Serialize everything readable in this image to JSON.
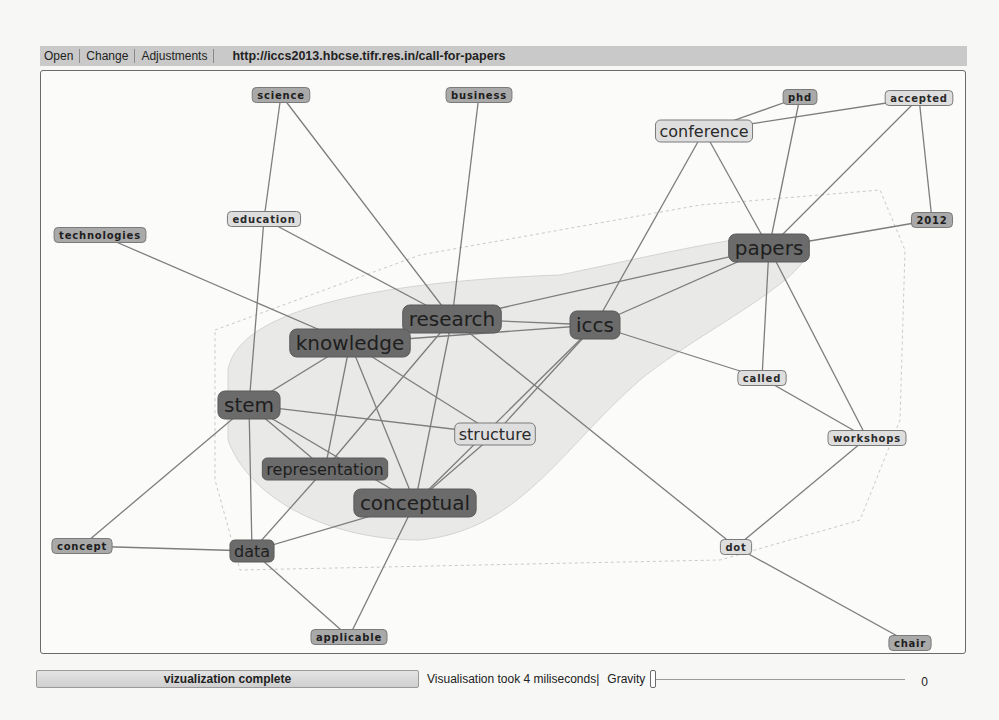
{
  "menubar": {
    "items": [
      "Open",
      "Change",
      "Adjustments"
    ],
    "url": "http://iccs2013.hbcse.tifr.res.in/call-for-papers"
  },
  "status": {
    "progress_label": "vizualization complete",
    "timing_text": "Visualisation took 4 miliseconds|",
    "gravity_label": "Gravity",
    "gravity_value": "0"
  },
  "colors": {
    "node_dark": "#6b6b6b",
    "node_medium": "#a9a9a9",
    "node_light": "#dedede",
    "node_border": "#7a7a7a",
    "edge": "#7d7d7d",
    "cluster_fill": "#e6e6e4"
  },
  "graph": {
    "nodes": [
      {
        "id": "science",
        "label": "science",
        "x": 281,
        "y": 95,
        "size": "small",
        "shade": "medium"
      },
      {
        "id": "business",
        "label": "business",
        "x": 479,
        "y": 95,
        "size": "small",
        "shade": "medium"
      },
      {
        "id": "phd",
        "label": "phd",
        "x": 800,
        "y": 97,
        "size": "small",
        "shade": "medium"
      },
      {
        "id": "accepted",
        "label": "accepted",
        "x": 919,
        "y": 98,
        "size": "small",
        "shade": "light"
      },
      {
        "id": "conference",
        "label": "conference",
        "x": 704,
        "y": 131,
        "size": "medium",
        "shade": "light"
      },
      {
        "id": "education",
        "label": "education",
        "x": 264,
        "y": 219,
        "size": "small",
        "shade": "light"
      },
      {
        "id": "technologies",
        "label": "technologies",
        "x": 100,
        "y": 235,
        "size": "small",
        "shade": "medium"
      },
      {
        "id": "2012",
        "label": "2012",
        "x": 932,
        "y": 220,
        "size": "small",
        "shade": "medium"
      },
      {
        "id": "papers",
        "label": "papers",
        "x": 769,
        "y": 248,
        "size": "large",
        "shade": "dark"
      },
      {
        "id": "research",
        "label": "research",
        "x": 452,
        "y": 319,
        "size": "large",
        "shade": "dark"
      },
      {
        "id": "iccs",
        "label": "iccs",
        "x": 595,
        "y": 325,
        "size": "large",
        "shade": "dark"
      },
      {
        "id": "knowledge",
        "label": "knowledge",
        "x": 350,
        "y": 343,
        "size": "large",
        "shade": "dark"
      },
      {
        "id": "called",
        "label": "called",
        "x": 762,
        "y": 378,
        "size": "small",
        "shade": "light"
      },
      {
        "id": "stem",
        "label": "stem",
        "x": 249,
        "y": 405,
        "size": "large",
        "shade": "dark"
      },
      {
        "id": "structure",
        "label": "structure",
        "x": 495,
        "y": 434,
        "size": "medium",
        "shade": "light"
      },
      {
        "id": "workshops",
        "label": "workshops",
        "x": 867,
        "y": 438,
        "size": "small",
        "shade": "light"
      },
      {
        "id": "representation",
        "label": "representation",
        "x": 325,
        "y": 469,
        "size": "medium",
        "shade": "dark"
      },
      {
        "id": "conceptual",
        "label": "conceptual",
        "x": 415,
        "y": 503,
        "size": "large",
        "shade": "dark"
      },
      {
        "id": "concept",
        "label": "concept",
        "x": 82,
        "y": 546,
        "size": "small",
        "shade": "medium"
      },
      {
        "id": "data",
        "label": "data",
        "x": 252,
        "y": 551,
        "size": "medium",
        "shade": "dark"
      },
      {
        "id": "dot",
        "label": "dot",
        "x": 736,
        "y": 547,
        "size": "small",
        "shade": "light"
      },
      {
        "id": "applicable",
        "label": "applicable",
        "x": 349,
        "y": 637,
        "size": "small",
        "shade": "medium"
      },
      {
        "id": "chair",
        "label": "chair",
        "x": 910,
        "y": 643,
        "size": "small",
        "shade": "medium"
      }
    ],
    "edges": [
      [
        "science",
        "education"
      ],
      [
        "science",
        "research"
      ],
      [
        "business",
        "research"
      ],
      [
        "technologies",
        "knowledge"
      ],
      [
        "education",
        "stem"
      ],
      [
        "education",
        "research"
      ],
      [
        "phd",
        "conference"
      ],
      [
        "phd",
        "papers"
      ],
      [
        "accepted",
        "conference"
      ],
      [
        "accepted",
        "papers"
      ],
      [
        "accepted",
        "2012"
      ],
      [
        "conference",
        "iccs"
      ],
      [
        "conference",
        "papers"
      ],
      [
        "2012",
        "papers"
      ],
      [
        "papers",
        "research"
      ],
      [
        "papers",
        "iccs"
      ],
      [
        "papers",
        "called"
      ],
      [
        "papers",
        "workshops"
      ],
      [
        "research",
        "iccs"
      ],
      [
        "research",
        "knowledge"
      ],
      [
        "research",
        "representation"
      ],
      [
        "research",
        "conceptual"
      ],
      [
        "research",
        "dot"
      ],
      [
        "knowledge",
        "iccs"
      ],
      [
        "knowledge",
        "stem"
      ],
      [
        "knowledge",
        "representation"
      ],
      [
        "knowledge",
        "conceptual"
      ],
      [
        "knowledge",
        "structure"
      ],
      [
        "iccs",
        "called"
      ],
      [
        "iccs",
        "structure"
      ],
      [
        "iccs",
        "conceptual"
      ],
      [
        "stem",
        "structure"
      ],
      [
        "stem",
        "representation"
      ],
      [
        "stem",
        "conceptual"
      ],
      [
        "stem",
        "data"
      ],
      [
        "stem",
        "concept"
      ],
      [
        "structure",
        "conceptual"
      ],
      [
        "representation",
        "data"
      ],
      [
        "conceptual",
        "data"
      ],
      [
        "conceptual",
        "applicable"
      ],
      [
        "concept",
        "data"
      ],
      [
        "data",
        "applicable"
      ],
      [
        "called",
        "workshops"
      ],
      [
        "workshops",
        "dot"
      ],
      [
        "dot",
        "chair"
      ]
    ]
  }
}
